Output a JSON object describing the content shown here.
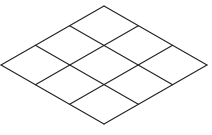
{
  "diagram": {
    "type": "isometric-grid",
    "rows": 3,
    "cols": 3,
    "line_color": "#222222",
    "background": "#ffffff",
    "vertices": {
      "top": [
        104,
        6
      ],
      "right": [
        207,
        65
      ],
      "bottom": [
        104,
        124
      ],
      "left": [
        1,
        65
      ]
    }
  }
}
